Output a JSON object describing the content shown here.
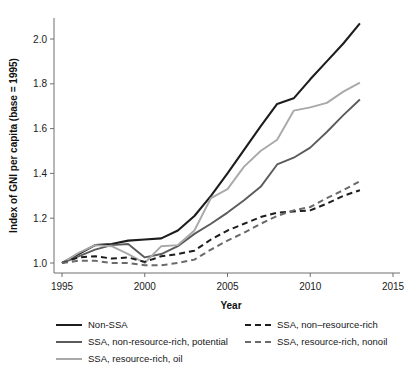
{
  "chart_data": {
    "type": "line",
    "title": "",
    "xlabel": "Year",
    "ylabel": "Index of GNI per capita (base = 1995)",
    "xlim": [
      1995,
      2015
    ],
    "ylim": [
      0.96,
      2.12
    ],
    "xticks": [
      1995,
      2000,
      2005,
      2010,
      2015
    ],
    "xtick_labels": [
      "1995",
      "2000",
      "2005",
      "2010",
      "2015"
    ],
    "yticks": [
      1.0,
      1.2,
      1.4,
      1.6,
      1.8,
      2.0
    ],
    "ytick_labels": [
      "1.0",
      "1.2",
      "1.4",
      "1.6",
      "1.8",
      "2.0"
    ],
    "grid": false,
    "legend_position": "below-axes",
    "x": [
      1995,
      1996,
      1997,
      1998,
      1999,
      2000,
      2001,
      2002,
      2003,
      2004,
      2005,
      2006,
      2007,
      2008,
      2009,
      2010,
      2011,
      2012,
      2013
    ],
    "series": [
      {
        "name": "Non-SSA",
        "style": "solid",
        "color": "#1d1d1d",
        "width": 2.1,
        "values": [
          1.0,
          1.04,
          1.08,
          1.085,
          1.1,
          1.105,
          1.11,
          1.145,
          1.21,
          1.3,
          1.4,
          1.505,
          1.61,
          1.71,
          1.735,
          1.82,
          1.9,
          1.98,
          2.07
        ]
      },
      {
        "name": "SSA, non-resource-rich, potential",
        "style": "solid",
        "color": "#5b5b5b",
        "width": 1.9,
        "values": [
          1.0,
          1.03,
          1.06,
          1.08,
          1.085,
          1.025,
          1.04,
          1.075,
          1.13,
          1.175,
          1.225,
          1.28,
          1.34,
          1.44,
          1.47,
          1.515,
          1.585,
          1.66,
          1.73
        ]
      },
      {
        "name": "SSA, resource-rich, oil",
        "style": "solid",
        "color": "#a9a9a9",
        "width": 1.9,
        "values": [
          1.0,
          1.045,
          1.08,
          1.075,
          1.04,
          1.0,
          1.075,
          1.08,
          1.145,
          1.29,
          1.33,
          1.43,
          1.5,
          1.55,
          1.68,
          1.695,
          1.715,
          1.765,
          1.805
        ]
      },
      {
        "name": "SSA, non–resource-rich",
        "style": "dashed",
        "color": "#1d1d1d",
        "width": 2.0,
        "values": [
          1.0,
          1.025,
          1.03,
          1.02,
          1.025,
          1.005,
          1.03,
          1.04,
          1.055,
          1.105,
          1.145,
          1.175,
          1.205,
          1.225,
          1.23,
          1.235,
          1.265,
          1.3,
          1.325
        ]
      },
      {
        "name": "SSA, resource-rich, nonoil",
        "style": "dashed",
        "color": "#6a6a6a",
        "width": 2.0,
        "values": [
          1.0,
          1.01,
          1.01,
          1.0,
          1.0,
          0.99,
          0.99,
          1.0,
          1.015,
          1.06,
          1.1,
          1.135,
          1.175,
          1.21,
          1.235,
          1.25,
          1.29,
          1.325,
          1.365
        ]
      }
    ]
  },
  "legend": {
    "left_items": [
      {
        "label": "Non-SSA",
        "color": "#1d1d1d",
        "style": "solid",
        "width": 2.4
      },
      {
        "label": "SSA, non-resource-rich, potential",
        "color": "#5b5b5b",
        "style": "solid",
        "width": 2.0
      },
      {
        "label": "SSA, resource-rich, oil",
        "color": "#a9a9a9",
        "style": "solid",
        "width": 2.0
      }
    ],
    "right_items": [
      {
        "label": "SSA, non–resource-rich",
        "color": "#1d1d1d",
        "style": "dashed",
        "width": 2.4
      },
      {
        "label": "SSA, resource-rich, nonoil",
        "color": "#6a6a6a",
        "style": "dashed",
        "width": 2.2
      }
    ]
  },
  "colors": {
    "axis": "#6f6f6f",
    "text": "#1a1a1a",
    "background": "#ffffff"
  }
}
